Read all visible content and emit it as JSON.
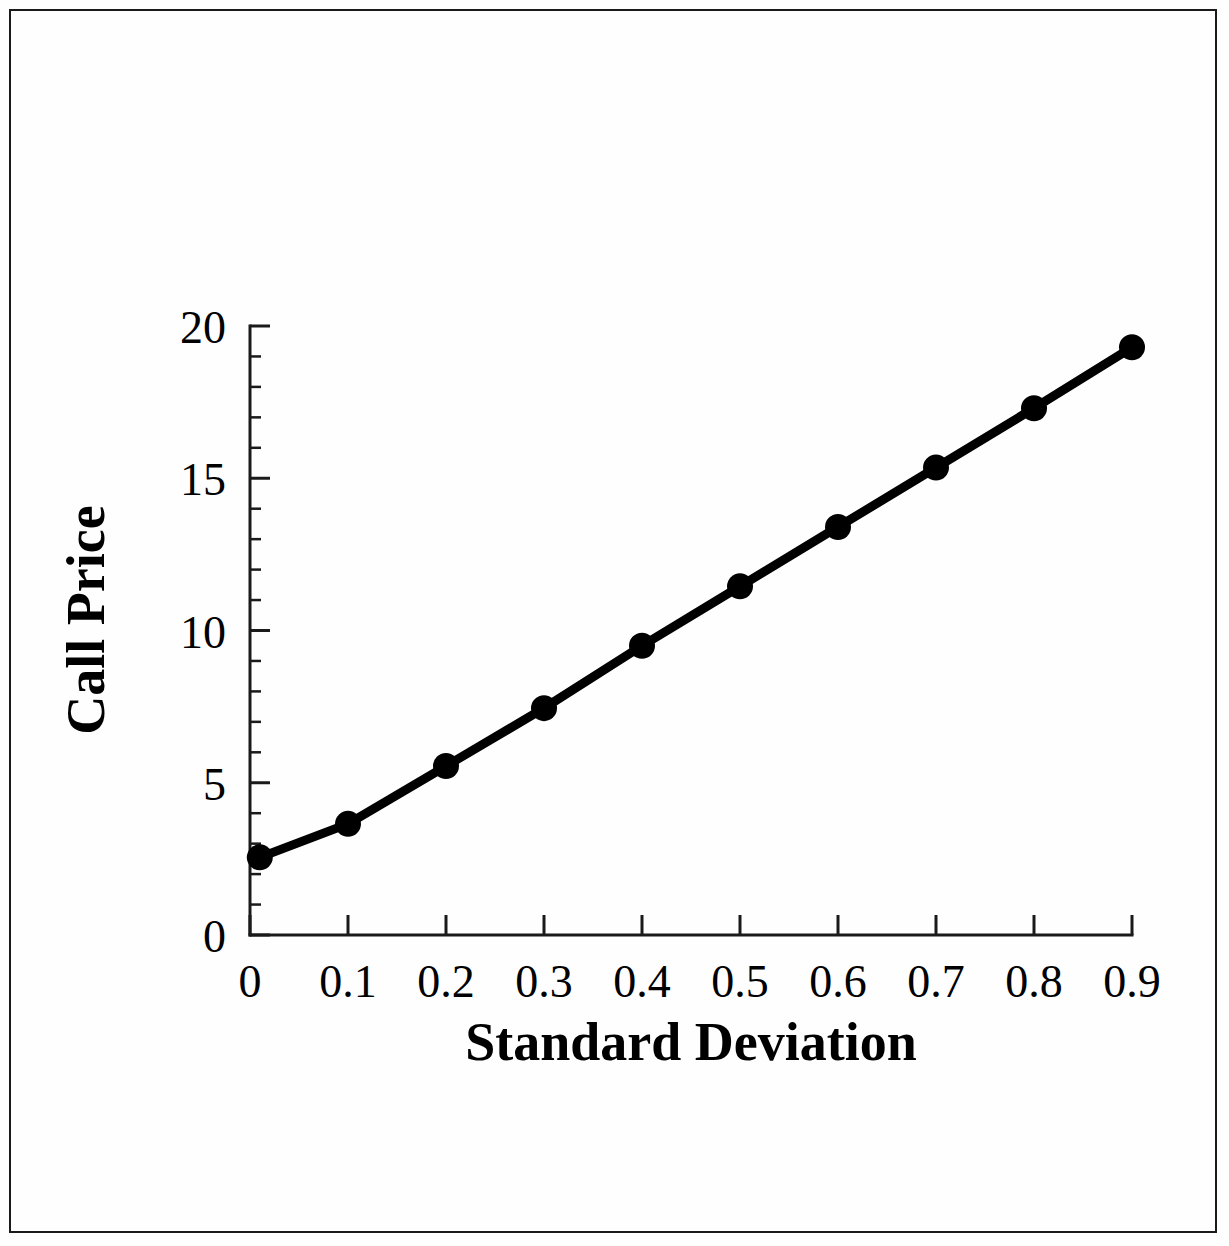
{
  "figure": {
    "frame_color": "#1a1a1a",
    "background_color": "#fefefe",
    "line_color": "#000000",
    "marker_color": "#000000"
  },
  "chart_data": {
    "type": "line",
    "title": "",
    "xlabel": "Standard Deviation",
    "ylabel": "Call Price",
    "xlim": [
      0,
      0.9
    ],
    "ylim": [
      0,
      20
    ],
    "grid": false,
    "legend": false,
    "marker": "filled-circle",
    "x": [
      0.01,
      0.1,
      0.2,
      0.3,
      0.4,
      0.5,
      0.6,
      0.7,
      0.8,
      0.9
    ],
    "values": [
      2.55,
      3.65,
      5.55,
      7.45,
      9.5,
      11.45,
      13.4,
      15.35,
      17.3,
      19.3
    ],
    "series": [
      {
        "name": "Call Price",
        "x": [
          0.01,
          0.1,
          0.2,
          0.3,
          0.4,
          0.5,
          0.6,
          0.7,
          0.8,
          0.9
        ],
        "values": [
          2.55,
          3.65,
          5.55,
          7.45,
          9.5,
          11.45,
          13.4,
          15.35,
          17.3,
          19.3
        ]
      }
    ],
    "xticks": [
      0,
      0.1,
      0.2,
      0.3,
      0.4,
      0.5,
      0.6,
      0.7,
      0.8,
      0.9
    ],
    "xtick_labels": [
      "0",
      "0.1",
      "0.2",
      "0.3",
      "0.4",
      "0.5",
      "0.6",
      "0.7",
      "0.8",
      "0.9"
    ],
    "yticks": [
      0,
      5,
      10,
      15,
      20
    ],
    "ytick_labels": [
      "0",
      "5",
      "10",
      "15",
      "20"
    ],
    "y_minor_tick_interval": 1,
    "x_minor_ticks": false
  },
  "axes": {
    "x_title": "Standard Deviation",
    "y_title": "Call Price"
  }
}
